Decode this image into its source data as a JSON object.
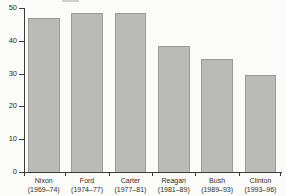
{
  "chart_data": {
    "type": "bar",
    "title": "",
    "xlabel": "",
    "ylabel": "",
    "categories": [
      {
        "name": "Nixon",
        "years": "(1969–74)"
      },
      {
        "name": "Ford",
        "years": "(1974–77)"
      },
      {
        "name": "Carter",
        "years": "(1977–81)"
      },
      {
        "name": "Reagan",
        "years": "(1981–89)"
      },
      {
        "name": "Bush",
        "years": "(1989–93)"
      },
      {
        "name": "Clinton",
        "years": "(1993–96)"
      }
    ],
    "values": [
      47,
      48.5,
      48.5,
      38.5,
      34.5,
      29.5
    ],
    "ylim": [
      0,
      50
    ],
    "yticks": [
      0,
      10,
      20,
      30,
      40,
      50
    ],
    "grid": false,
    "legend": null,
    "bar_color": "#babbb7",
    "bar_border_color": "#9b9b97",
    "axis_color": "#3a3a38",
    "text_color": "#2e2e2c",
    "background_color": "#fbfbf9"
  }
}
